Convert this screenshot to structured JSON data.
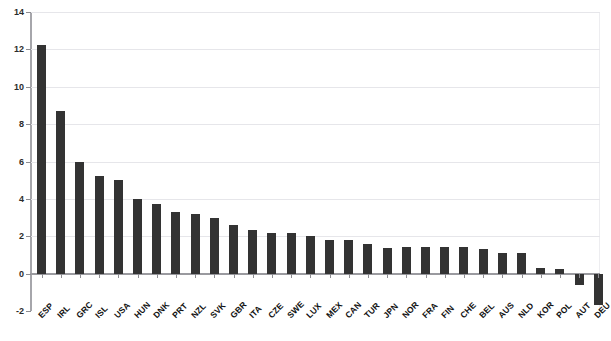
{
  "chart_data": {
    "type": "bar",
    "title": "",
    "xlabel": "",
    "ylabel": "",
    "ylim": [
      -2,
      14
    ],
    "yticks": [
      -2,
      0,
      2,
      4,
      6,
      8,
      10,
      12,
      14
    ],
    "ytick_labels": [
      "-2",
      "0",
      "2",
      "4",
      "6",
      "8",
      "10",
      "12",
      "14"
    ],
    "grid": true,
    "legend": "none",
    "bar_color": "#333333",
    "categories": [
      "ESP",
      "IRL",
      "GRC",
      "ISL",
      "USA",
      "HUN",
      "DNK",
      "PRT",
      "NZL",
      "SVK",
      "GBR",
      "ITA",
      "CZE",
      "SWE",
      "LUX",
      "MEX",
      "CAN",
      "TUR",
      "JPN",
      "NOR",
      "FRA",
      "FIN",
      "CHE",
      "BEL",
      "AUS",
      "NLD",
      "KOR",
      "POL",
      "AUT",
      "DEU"
    ],
    "values": [
      12.25,
      8.7,
      5.95,
      5.2,
      5.0,
      4.0,
      3.7,
      3.3,
      3.2,
      3.0,
      2.6,
      2.35,
      2.2,
      2.15,
      2.0,
      1.8,
      1.8,
      1.6,
      1.35,
      1.4,
      1.4,
      1.4,
      1.4,
      1.3,
      1.1,
      1.1,
      0.3,
      0.25,
      -0.6,
      -1.7
    ]
  },
  "axis": {
    "y_min_label": "-2",
    "y_max_label": "14"
  }
}
